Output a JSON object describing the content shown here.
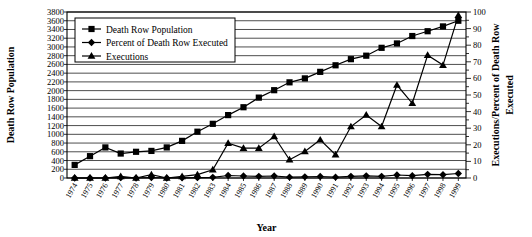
{
  "chart_data": {
    "type": "line",
    "title": "",
    "xlabel": "Year",
    "ylabel": "Death Row Population",
    "y2label": "Executions/Percent of Death Row Executed",
    "grid": true,
    "legend_position": "top-left",
    "ylim": [
      0,
      3800
    ],
    "ytick_step": 200,
    "y2lim": [
      0,
      100
    ],
    "y2tick_step": 10,
    "y2_minor_step": 5,
    "categories": [
      "1974",
      "1975",
      "1976",
      "1977",
      "1978",
      "1979",
      "1980",
      "1981",
      "1982",
      "1983",
      "1984",
      "1985",
      "1986",
      "1987",
      "1988",
      "1989",
      "1990",
      "1991",
      "1992",
      "1993",
      "1994",
      "1995",
      "1996",
      "1997",
      "1998",
      "1999"
    ],
    "yticks": [
      "0",
      "200",
      "400",
      "600",
      "800",
      "1000",
      "1200",
      "1400",
      "1600",
      "1800",
      "2000",
      "2200",
      "2400",
      "2600",
      "2800",
      "3000",
      "3200",
      "3400",
      "3600",
      "3800"
    ],
    "y2ticks": [
      "0",
      "10",
      "20",
      "30",
      "40",
      "50",
      "60",
      "70",
      "80",
      "90",
      "100"
    ],
    "series": [
      {
        "name": "Death Row Population",
        "axis": "left",
        "marker": "square",
        "values": [
          300,
          500,
          700,
          560,
          600,
          620,
          700,
          850,
          1060,
          1240,
          1440,
          1620,
          1840,
          2010,
          2190,
          2280,
          2430,
          2580,
          2720,
          2800,
          2980,
          3080,
          3250,
          3360,
          3470,
          3600
        ]
      },
      {
        "name": "Percent of Death Row Executed",
        "axis": "right",
        "marker": "diamond",
        "values": [
          0,
          0,
          0,
          0.2,
          0,
          0.3,
          0,
          0.1,
          0.2,
          0.4,
          1.5,
          1.2,
          1.0,
          1.2,
          0.5,
          0.7,
          0.9,
          0.5,
          1.0,
          1.3,
          1.0,
          1.8,
          1.4,
          2.2,
          2.0,
          2.7
        ]
      },
      {
        "name": "Executions",
        "axis": "right",
        "marker": "triangle",
        "values": [
          0,
          0,
          0,
          1,
          0,
          2,
          0,
          1,
          2,
          5,
          21,
          18,
          18,
          25,
          11,
          16,
          23,
          14,
          31,
          38,
          31,
          56,
          45,
          74,
          68,
          98
        ]
      }
    ]
  },
  "legend": {
    "items": [
      {
        "label": "Death Row Population",
        "marker": "square"
      },
      {
        "label": "Percent of Death Row Executed",
        "marker": "diamond"
      },
      {
        "label": "Executions",
        "marker": "triangle"
      }
    ]
  }
}
